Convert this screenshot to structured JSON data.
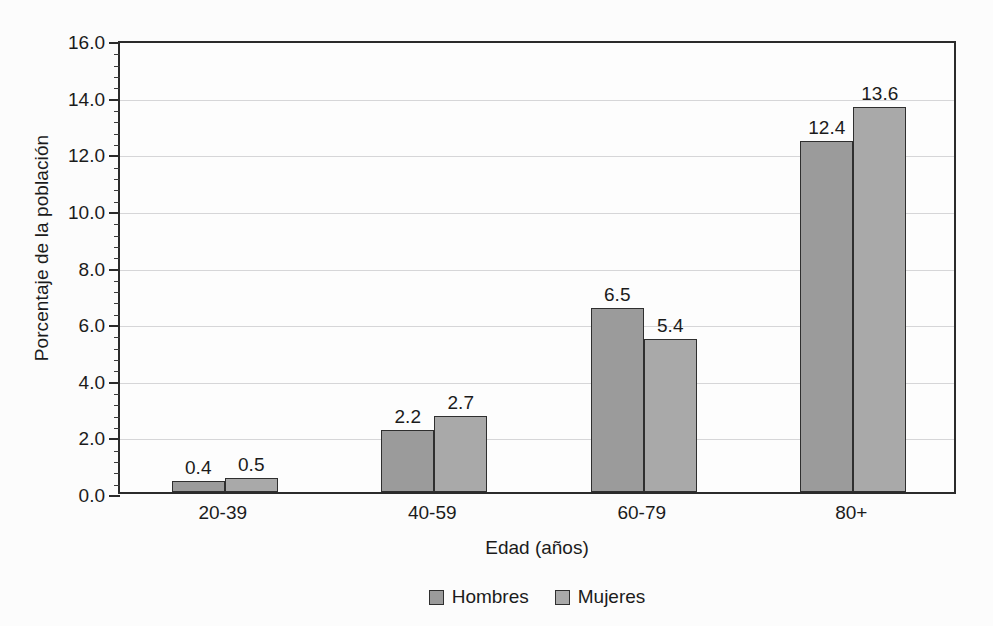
{
  "chart_data": {
    "type": "bar",
    "title": "",
    "xlabel": "Edad (años)",
    "ylabel": "Porcentaje de la población",
    "categories": [
      "20-39",
      "40-59",
      "60-79",
      "80+"
    ],
    "series": [
      {
        "name": "Hombres",
        "color": "#9b9b9b",
        "values": [
          0.4,
          2.2,
          6.5,
          12.4
        ]
      },
      {
        "name": "Mujeres",
        "color": "#a9a9a9",
        "values": [
          0.5,
          2.7,
          5.4,
          13.6
        ]
      }
    ],
    "value_labels": {
      "Hombres": [
        "0.4",
        "2.2",
        "6.5",
        "12.4"
      ],
      "Mujeres": [
        "0.5",
        "2.7",
        "5.4",
        "13.6"
      ]
    },
    "ylim": [
      0.0,
      16.0
    ],
    "ytick_values": [
      0.0,
      2.0,
      4.0,
      6.0,
      8.0,
      10.0,
      12.0,
      14.0,
      16.0
    ],
    "ytick_labels": [
      "0.0",
      "2.0",
      "4.0",
      "6.0",
      "8.0",
      "10.0",
      "12.0",
      "14.0",
      "16.0"
    ],
    "yminor_step": 0.4,
    "grid": "horizontal",
    "legend_position": "bottom-center",
    "legend_entries": [
      "Hombres",
      "Mujeres"
    ]
  }
}
